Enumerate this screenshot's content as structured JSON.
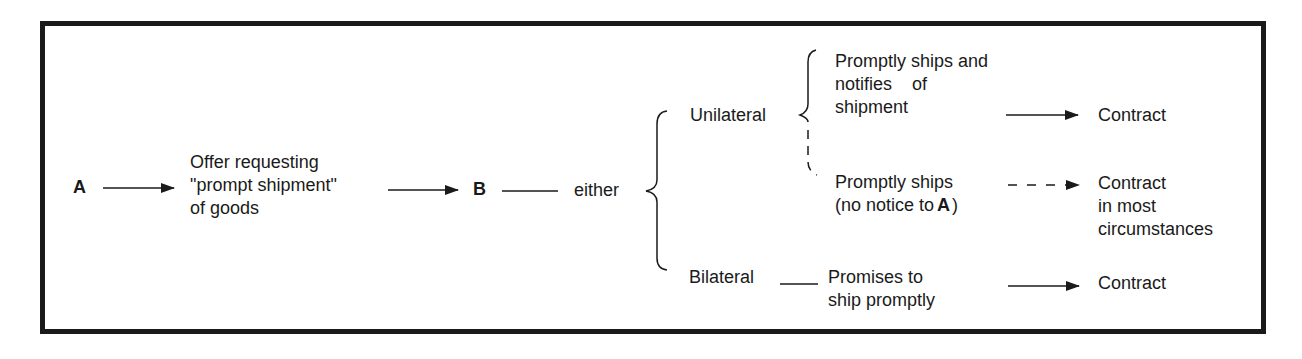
{
  "diagram": {
    "type": "flow",
    "nodes": {
      "a": "A",
      "offer": [
        "Offer requesting",
        "\"prompt shipment\"",
        "of goods"
      ],
      "b": "B",
      "either": "either",
      "unilateral": "Unilateral",
      "bilateral": "Bilateral",
      "uni_option_1": [
        "Promptly ships and",
        "notifies    of",
        "shipment"
      ],
      "uni_option_2_line1": "Promptly ships",
      "uni_option_2_line2_prefix": "(no notice to",
      "uni_option_2_line2_bold": "A",
      "uni_option_2_line2_suffix": ")",
      "bi_option": [
        "Promises to",
        "ship promptly"
      ],
      "result_1": "Contract",
      "result_2": [
        "Contract",
        "in most",
        "circumstances"
      ],
      "result_3": "Contract"
    },
    "edges": [
      {
        "from": "A",
        "to": "Offer requesting \"prompt shipment\" of goods",
        "style": "solid-arrow"
      },
      {
        "from": "Offer",
        "to": "B",
        "style": "solid-arrow"
      },
      {
        "from": "B",
        "to": "either",
        "style": "line"
      },
      {
        "from": "either",
        "to": [
          "Unilateral",
          "Bilateral"
        ],
        "style": "brace"
      },
      {
        "from": "Unilateral",
        "to": [
          "Promptly ships and notifies of shipment",
          "Promptly ships (no notice to A)"
        ],
        "style": "brace-partly-dashed"
      },
      {
        "from": "Promptly ships and notifies of shipment",
        "to": "Contract",
        "style": "solid-arrow"
      },
      {
        "from": "Promptly ships (no notice to A)",
        "to": "Contract in most circumstances",
        "style": "dashed-arrow"
      },
      {
        "from": "Bilateral",
        "to": "Promises to ship promptly",
        "style": "line"
      },
      {
        "from": "Promises to ship promptly",
        "to": "Contract",
        "style": "solid-arrow"
      }
    ],
    "colors": {
      "ink": "#1a1a1a",
      "background": "#ffffff"
    }
  }
}
